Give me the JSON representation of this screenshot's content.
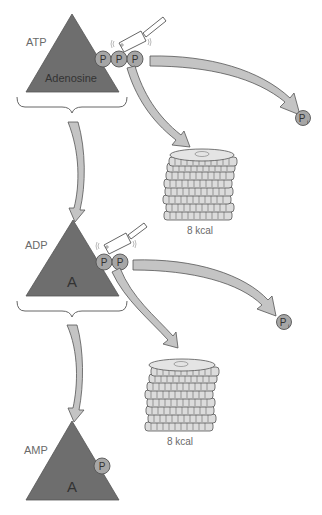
{
  "diagram": {
    "molecules": [
      {
        "label": "ATP",
        "base_label": "Adenosine",
        "phosphates": [
          "P",
          "P",
          "P"
        ]
      },
      {
        "label": "ADP",
        "base_label": "A",
        "phosphates": [
          "P",
          "P"
        ]
      },
      {
        "label": "AMP",
        "base_label": "A",
        "phosphates": [
          "P"
        ]
      }
    ],
    "released": [
      {
        "phosphate": "P",
        "subscript": "i",
        "energy": "8 kcal"
      },
      {
        "phosphate": "P",
        "subscript": "i",
        "energy": "8 kcal"
      }
    ],
    "colors": {
      "triangle": "#6e6e6e",
      "phosphate": "#a6a6a6",
      "arrow": "#c4c4c4",
      "coin": "#d8d8d8",
      "text": "#6a6a6a"
    }
  }
}
